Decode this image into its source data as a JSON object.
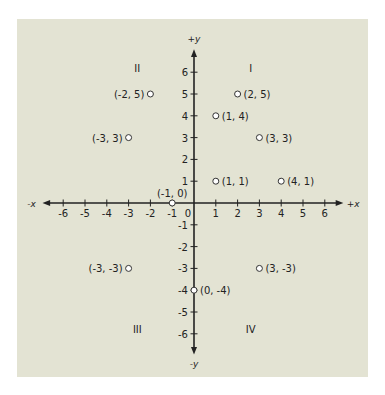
{
  "chart_data": {
    "type": "scatter",
    "title": "",
    "xlabel_pos": "+x",
    "xlabel_neg": "-x",
    "ylabel_pos": "+y",
    "ylabel_neg": "-y",
    "xlim": [
      -6,
      6
    ],
    "ylim": [
      -6,
      6
    ],
    "grid": false,
    "x_ticks": [
      -6,
      -5,
      -4,
      -3,
      -2,
      -1,
      0,
      1,
      2,
      3,
      4,
      5,
      6
    ],
    "y_ticks": [
      6,
      5,
      4,
      3,
      2,
      1,
      -1,
      -2,
      -3,
      -4,
      -5,
      -6
    ],
    "quadrants": [
      {
        "label": "I",
        "x": 2.6,
        "y": 6.2
      },
      {
        "label": "II",
        "x": -2.6,
        "y": 6.2
      },
      {
        "label": "III",
        "x": -2.6,
        "y": -5.8
      },
      {
        "label": "IV",
        "x": 2.6,
        "y": -5.8
      }
    ],
    "points": [
      {
        "x": -2,
        "y": 5,
        "label": "(-2, 5)",
        "label_side": "left"
      },
      {
        "x": 2,
        "y": 5,
        "label": "(2, 5)",
        "label_side": "right"
      },
      {
        "x": 1,
        "y": 4,
        "label": "(1, 4)",
        "label_side": "right"
      },
      {
        "x": -3,
        "y": 3,
        "label": "(-3, 3)",
        "label_side": "left"
      },
      {
        "x": 3,
        "y": 3,
        "label": "(3, 3)",
        "label_side": "right"
      },
      {
        "x": 1,
        "y": 1,
        "label": "(1, 1)",
        "label_side": "right"
      },
      {
        "x": 4,
        "y": 1,
        "label": "(4, 1)",
        "label_side": "right"
      },
      {
        "x": -1,
        "y": 0,
        "label": "(-1, 0)",
        "label_side": "above"
      },
      {
        "x": -3,
        "y": -3,
        "label": "(-3, -3)",
        "label_side": "left"
      },
      {
        "x": 3,
        "y": -3,
        "label": "(3, -3)",
        "label_side": "right"
      },
      {
        "x": 0,
        "y": -4,
        "label": "(0, -4)",
        "label_side": "right"
      }
    ]
  },
  "colors": {
    "background": "#e3e3d3",
    "axis": "#222222",
    "point_fill": "#ffffff",
    "point_stroke": "#333333"
  }
}
